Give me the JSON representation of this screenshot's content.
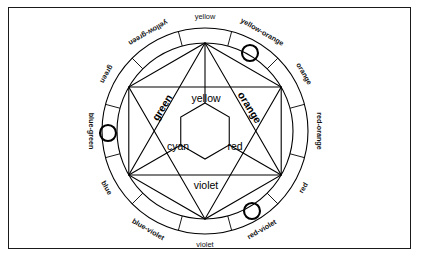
{
  "diagram": {
    "background_color": "#ffffff",
    "line_color": "#000000",
    "frame_color": "#1a1a1a",
    "center": {
      "x": 205,
      "y": 131
    },
    "outer_radius": 103,
    "inner_radius": 88,
    "hub_radius": 28,
    "ring_segment_count": 12
  },
  "ring": {
    "segments": [
      {
        "index": 0,
        "label": "yellow",
        "angle_deg": -90,
        "bold": false,
        "marker": false
      },
      {
        "index": 1,
        "label": "yellow-orange",
        "angle_deg": -60,
        "bold": true,
        "marker": true
      },
      {
        "index": 2,
        "label": "orange",
        "angle_deg": -30,
        "bold": true,
        "marker": false
      },
      {
        "index": 3,
        "label": "red-orange",
        "angle_deg": 0,
        "bold": true,
        "marker": false
      },
      {
        "index": 4,
        "label": "red",
        "angle_deg": 30,
        "bold": true,
        "marker": false
      },
      {
        "index": 5,
        "label": "red-violet",
        "angle_deg": 60,
        "bold": true,
        "marker": true
      },
      {
        "index": 6,
        "label": "violet",
        "angle_deg": 90,
        "bold": false,
        "marker": false
      },
      {
        "index": 7,
        "label": "blue-violet",
        "angle_deg": 120,
        "bold": true,
        "marker": false
      },
      {
        "index": 8,
        "label": "blue",
        "angle_deg": 150,
        "bold": true,
        "marker": false
      },
      {
        "index": 9,
        "label": "blue-green",
        "angle_deg": 180,
        "bold": true,
        "marker": true
      },
      {
        "index": 10,
        "label": "green",
        "angle_deg": 210,
        "bold": true,
        "marker": false
      },
      {
        "index": 11,
        "label": "yellow-green",
        "angle_deg": 240,
        "bold": true,
        "marker": false
      }
    ]
  },
  "inner": {
    "regions": [
      {
        "name": "green",
        "label": "green",
        "x": 163,
        "y": 108,
        "rotation": -58,
        "bold": true
      },
      {
        "name": "yellow",
        "label": "yellow",
        "x": 206,
        "y": 99,
        "rotation": 0,
        "bold": false
      },
      {
        "name": "orange",
        "label": "orange",
        "x": 249,
        "y": 108,
        "rotation": 58,
        "bold": true
      },
      {
        "name": "cyan",
        "label": "cyan",
        "x": 178,
        "y": 147,
        "rotation": 0,
        "bold": false
      },
      {
        "name": "red",
        "label": "red",
        "x": 235,
        "y": 147,
        "rotation": 0,
        "bold": false
      },
      {
        "name": "violet",
        "label": "violet",
        "x": 206,
        "y": 186,
        "rotation": 0,
        "bold": false
      }
    ]
  },
  "markers": {
    "radius": 8,
    "positions": [
      {
        "name": "marker-yellow-orange",
        "x": 250,
        "y": 53
      },
      {
        "name": "marker-blue-green",
        "x": 108,
        "y": 133
      },
      {
        "name": "marker-red-violet",
        "x": 252,
        "y": 211
      }
    ]
  }
}
